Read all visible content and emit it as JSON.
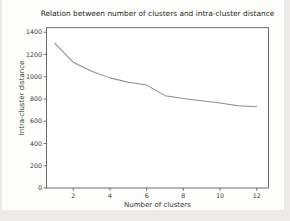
{
  "figure": {
    "page_background": "#ecebe9",
    "figure_background": "#fdfdfc"
  },
  "chart_data": {
    "type": "line",
    "title": "Relation between number of clusters and intra-cluster distance",
    "xlabel": "Number of clusters",
    "ylabel": "Intra-cluster distance",
    "x": [
      1,
      2,
      3,
      4,
      5,
      6,
      7,
      8,
      9,
      10,
      11,
      12
    ],
    "y": [
      1300,
      1130,
      1050,
      990,
      950,
      925,
      830,
      805,
      785,
      765,
      740,
      730
    ],
    "xticks": [
      2,
      4,
      6,
      8,
      10,
      12
    ],
    "yticks": [
      0,
      200,
      400,
      600,
      800,
      1000,
      1200,
      1400
    ],
    "xlim": [
      0.54,
      12.64
    ],
    "ylim": [
      0,
      1441
    ],
    "grid": false,
    "legend": null,
    "line_color": "#8c8c8c",
    "axis_color": "#454545",
    "tick_label_color": "#3a3a3a",
    "title_color": "#262626",
    "axis_label_color": "#333333"
  }
}
